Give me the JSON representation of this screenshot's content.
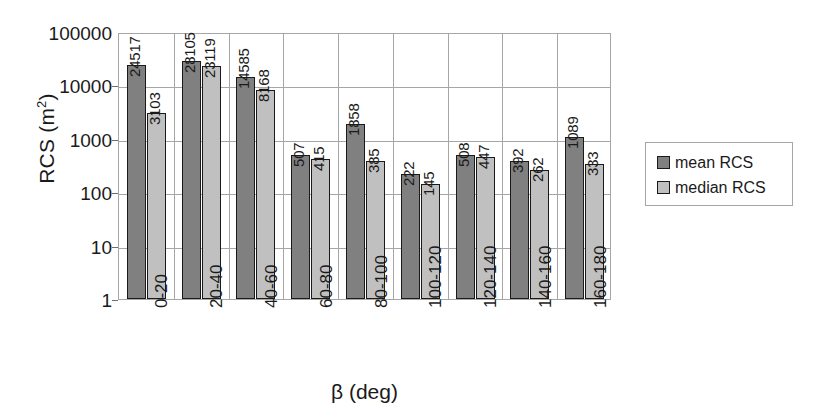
{
  "chart_data": {
    "type": "bar",
    "title": "",
    "xlabel": "β (deg)",
    "ylabel": "RCS (m2)",
    "ylabel_base": "RCS (m",
    "ylabel_sup": "2",
    "ylabel_tail": ")",
    "yscale": "log",
    "ylim": [
      1,
      100000
    ],
    "ytick_labels": [
      "100000",
      "10000",
      "1000",
      "100",
      "10",
      "1"
    ],
    "ytick_values": [
      100000,
      10000,
      1000,
      100,
      10,
      1
    ],
    "grid": true,
    "legend_position": "right",
    "categories": [
      "0-20",
      "20-40",
      "40-60",
      "60-80",
      "80-100",
      "100-120",
      "120-140",
      "140-160",
      "160-180"
    ],
    "series": [
      {
        "name": "mean RCS",
        "color": "#808080",
        "values": [
          24517,
          28105,
          14585,
          507,
          1858,
          222,
          508,
          392,
          1089
        ],
        "labels": [
          "24517",
          "28105",
          "14585",
          "507",
          "1858",
          "222",
          "508",
          "392",
          "1089"
        ]
      },
      {
        "name": "median RCS",
        "color": "#c0c0c0",
        "values": [
          3103,
          23119,
          8168,
          415,
          385,
          145,
          447,
          262,
          333
        ],
        "labels": [
          "3103",
          "23119",
          "8168",
          "415",
          "385",
          "145",
          "447",
          "262",
          "333"
        ]
      }
    ]
  },
  "legend": {
    "entries": [
      {
        "label": "mean RCS",
        "color": "#808080"
      },
      {
        "label": "median RCS",
        "color": "#c0c0c0"
      }
    ]
  },
  "colors": {
    "mean": "#808080",
    "median": "#c0c0c0",
    "gridline": "#a6a6a6",
    "text": "#1a1a1a",
    "background": "#ffffff"
  }
}
